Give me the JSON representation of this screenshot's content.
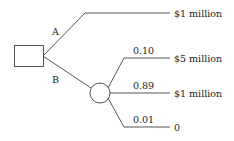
{
  "diagram": {
    "type": "decision-tree",
    "decision_node": {
      "shape": "square"
    },
    "chance_node": {
      "shape": "circle"
    },
    "branches": [
      {
        "label": "A",
        "outcome": "$1 million"
      },
      {
        "label": "B",
        "outcomes": [
          {
            "probability": "0.10",
            "payoff": "$5 million"
          },
          {
            "probability": "0.89",
            "payoff": "$1 million"
          },
          {
            "probability": "0.01",
            "payoff": "0"
          }
        ]
      }
    ]
  }
}
